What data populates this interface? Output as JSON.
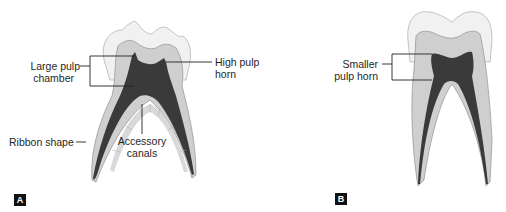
{
  "figure": {
    "panel_a": {
      "tag": "A",
      "labels": {
        "large_pulp_chamber": [
          "Large pulp",
          "chamber"
        ],
        "high_pulp_horn": [
          "High pulp",
          "horn"
        ],
        "ribbon_shape": "Ribbon shape",
        "accessory_canals": [
          "Accessory",
          "canals"
        ]
      }
    },
    "panel_b": {
      "tag": "B",
      "labels": {
        "smaller_pulp_horn": [
          "Smaller",
          "pulp horn"
        ]
      }
    },
    "colors": {
      "enamel": "#f1f1f1",
      "dentin": "#cfcfcf",
      "pulp": "#3a3a3a",
      "outline": "#9a9a9a",
      "leader": "#222222"
    }
  }
}
